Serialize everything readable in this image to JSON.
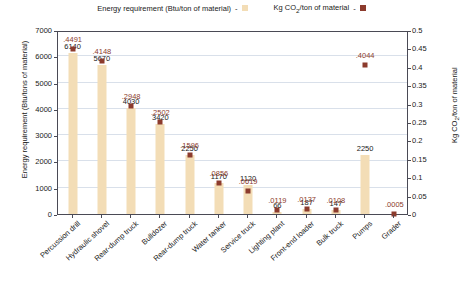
{
  "chart_data": {
    "type": "bar",
    "title": "",
    "subtitle": "",
    "xlabel": "",
    "ylabel": "Energy requirement (Btu/tons of material)",
    "y2label": "Kg CO2/ton of material",
    "ylim": [
      0,
      7000
    ],
    "y2lim": [
      0,
      0.5
    ],
    "yticks": [
      "0",
      "1000",
      "2000",
      "3000",
      "4000",
      "5000",
      "6000",
      "7000"
    ],
    "y2ticks": [
      "0",
      "0.05",
      "0.1",
      "0.15",
      "0.2",
      "0.25",
      "0.3",
      "0.35",
      "0.4",
      "0.45",
      "0.5"
    ],
    "grid": true,
    "legend_position": "top",
    "categories": [
      "Percussion drill",
      "Hydraulic shovel",
      "Rear-dump truck",
      "Bulldozer",
      "Rear-dump truck",
      "Water tanker",
      "Service truck",
      "Lighting plant",
      "Front-end loader",
      "Bulk truck",
      "Pumps",
      "Grader"
    ],
    "series": [
      {
        "name": "Energy requirement (Btu/ton of material)",
        "type": "bar",
        "axis": "left",
        "color": "#f3ddb6",
        "values": [
          6140,
          5670,
          4030,
          3420,
          2250,
          1170,
          1120,
          66,
          187,
          147,
          2250,
          0
        ],
        "labels": [
          "6140",
          "5670",
          "4030",
          "3420",
          "2250",
          "1170",
          "1120",
          "66",
          "187",
          "147",
          "2250",
          ""
        ]
      },
      {
        "name": "Kg CO2/ton of material",
        "type": "scatter",
        "axis": "right",
        "color": "#8c3b2d",
        "values": [
          0.4491,
          0.4148,
          0.2948,
          0.2502,
          0.1596,
          0.0856,
          0.0619,
          0.0119,
          0.0137,
          0.0108,
          0.4044,
          0.0005
        ],
        "labels": [
          ".4491",
          ".4148",
          ".2948",
          ".2502",
          ".1596",
          ".0856",
          ".0619",
          ".0119",
          ".0137",
          ".0108",
          ".4044",
          ".0005"
        ]
      }
    ]
  },
  "legend": {
    "entries": [
      {
        "label": "Energy requirement (Btu/ton of material)",
        "dash": "-",
        "color": "#f3ddb6"
      },
      {
        "label": "Kg CO",
        "sub": "2",
        "label_tail": "/ton of material",
        "dash": "-",
        "color": "#8c3b2d"
      }
    ]
  },
  "axes": {
    "left_title_a": "Energy requirement (Btu/tons of material)",
    "right_title_a": "Kg CO",
    "right_title_sub": "2",
    "right_title_b": "/ton of material"
  }
}
